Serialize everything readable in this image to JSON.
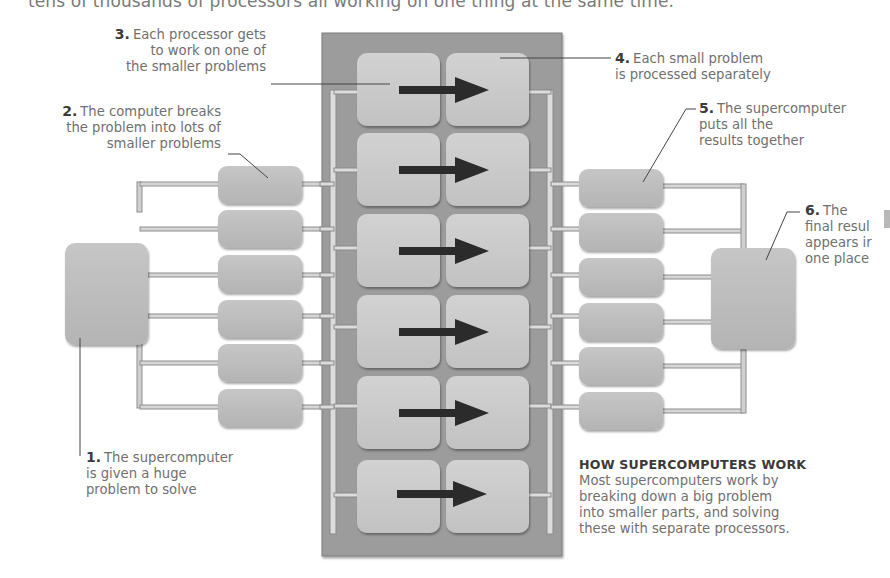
{
  "intro_text": "tens of thousands of processors all working on one thing at the same time.",
  "labels": [
    {
      "id": "step-1",
      "num": "1.",
      "lines": [
        "The supercomputer",
        "is given a huge",
        "problem to solve"
      ]
    },
    {
      "id": "step-2",
      "num": "2.",
      "lines": [
        "The computer breaks",
        "the problem into lots of",
        "smaller problems"
      ]
    },
    {
      "id": "step-3",
      "num": "3.",
      "lines": [
        "Each processor gets",
        "to work on one of",
        "the smaller problems"
      ]
    },
    {
      "id": "step-4",
      "num": "4.",
      "lines": [
        "Each small problem",
        "is processed separately"
      ]
    },
    {
      "id": "step-5",
      "num": "5.",
      "lines": [
        "The supercomputer",
        "puts all the",
        "results together"
      ]
    },
    {
      "id": "step-6",
      "num": "6.",
      "lines": [
        "The",
        "final resul",
        "appears ir",
        "one place"
      ]
    }
  ],
  "info_box": {
    "heading": "HOW SUPERCOMPUTERS WORK",
    "lines": [
      "Most supercomputers work by",
      "breaking down a big problem",
      "into smaller parts, and solving",
      "these with separate processors."
    ]
  },
  "diagram": {
    "processor_rows": 6,
    "split_boxes": 6,
    "merge_boxes": 6,
    "colors": {
      "panel": "#9a9a9a",
      "panel_border": "#7d7d7d",
      "box": "#bdbdbd",
      "processor_box": "#c9c9c9",
      "bus": "#d8d8d8",
      "bus_edge": "#8e8e8e",
      "arrow": "#2b2b2b",
      "text": "#707070",
      "text_bold": "#3a3a3a"
    }
  }
}
